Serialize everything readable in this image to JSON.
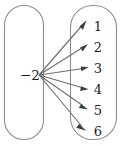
{
  "diagram": {
    "type": "mapping-diagram",
    "title": "",
    "domain": {
      "name": "domain-oval",
      "elements": [
        {
          "label": "−2",
          "x": 30,
          "y": 77
        }
      ]
    },
    "codomain": {
      "name": "codomain-oval",
      "elements": [
        {
          "label": "1",
          "x": 98,
          "y": 27
        },
        {
          "label": "2",
          "x": 98,
          "y": 48
        },
        {
          "label": "3",
          "x": 98,
          "y": 69
        },
        {
          "label": "4",
          "x": 98,
          "y": 90
        },
        {
          "label": "5",
          "x": 98,
          "y": 111
        },
        {
          "label": "6",
          "x": 98,
          "y": 132
        }
      ]
    },
    "arrows": [
      {
        "from": "−2",
        "to": "1"
      },
      {
        "from": "−2",
        "to": "2"
      },
      {
        "from": "−2",
        "to": "3"
      },
      {
        "from": "−2",
        "to": "4"
      },
      {
        "from": "−2",
        "to": "5"
      },
      {
        "from": "−2",
        "to": "6"
      }
    ],
    "colors": {
      "oval_stroke": "#8d8d8d",
      "arrow_stroke": "#6f6f6f",
      "arrow_head": "#3d3d3d",
      "text": "#1b1b1b",
      "background": "#ffffff"
    }
  }
}
